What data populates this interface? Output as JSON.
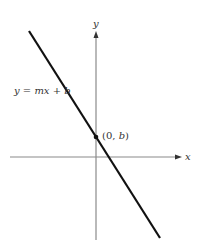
{
  "diagram": {
    "type": "line-graph",
    "x_axis_label": "x",
    "y_axis_label": "y",
    "line_equation": "y = mx + b",
    "intercept_label_open": "(0, ",
    "intercept_label_var": "b",
    "intercept_label_close": ")",
    "colors": {
      "axis": "#8a8a8a",
      "line": "#111111",
      "text": "#333333"
    }
  }
}
